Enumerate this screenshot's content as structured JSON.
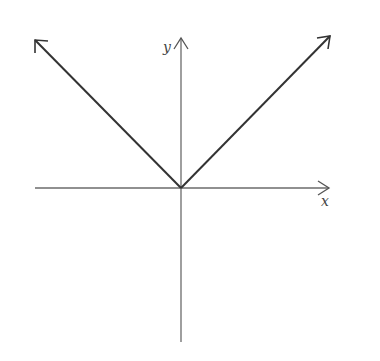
{
  "diagram": {
    "title": "",
    "axes": {
      "x_label": "x",
      "y_label": "y"
    },
    "function": "y = |x|",
    "colors": {
      "axis": "#6b6b6b",
      "curve": "#333333",
      "background": "#ffffff"
    }
  }
}
